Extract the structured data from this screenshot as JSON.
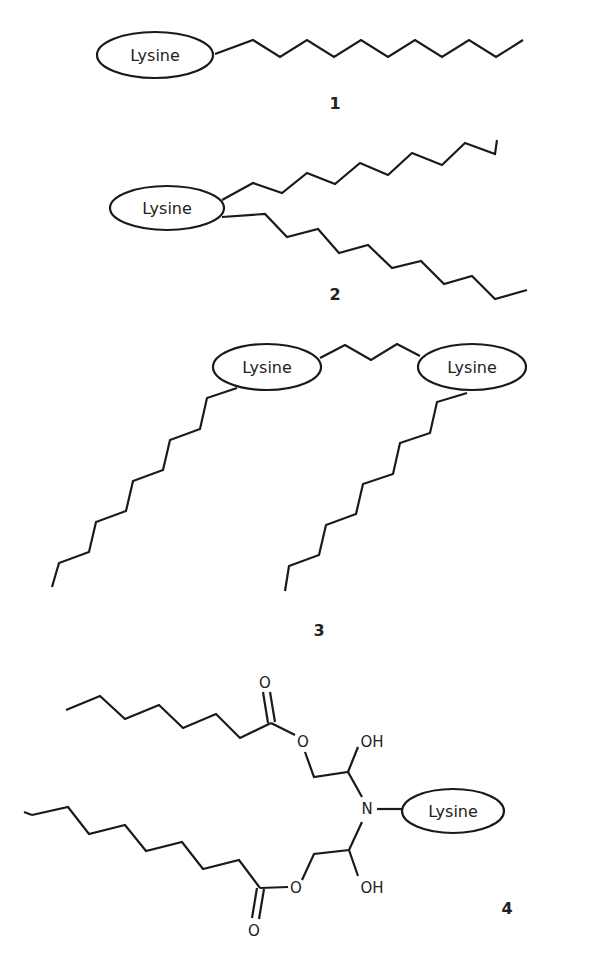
{
  "figure": {
    "structures": [
      {
        "id": "1",
        "label": "1",
        "description": "Lysine head group with a single long alkyl chain",
        "head_groups": [
          "Lysine"
        ],
        "chains": 1
      },
      {
        "id": "2",
        "label": "2",
        "description": "Lysine head group with two alkyl chains",
        "head_groups": [
          "Lysine"
        ],
        "chains": 2
      },
      {
        "id": "3",
        "label": "3",
        "description": "Gemini-type: two Lysine head groups joined by a short spacer, each bearing one alkyl chain",
        "head_groups": [
          "Lysine",
          "Lysine"
        ],
        "chains": 2
      },
      {
        "id": "4",
        "label": "4",
        "description": "Lysine attached to N of a diol diester bearing two acyl chains",
        "head_groups": [
          "Lysine"
        ],
        "atoms": {
          "carbonyl_o_top": "O",
          "ester_o_top": "O",
          "oh_top": "OH",
          "nitrogen": "N",
          "ester_o_bottom": "O",
          "oh_bottom": "OH",
          "carbonyl_o_bottom": "O"
        }
      }
    ],
    "head_group_text": "Lysine"
  },
  "colors": {
    "line": "#1a1a1a",
    "background": "#ffffff"
  }
}
